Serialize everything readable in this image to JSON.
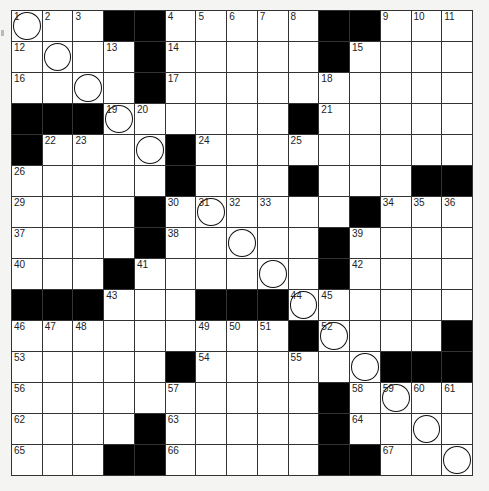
{
  "puzzle": {
    "rows": 15,
    "cols": 15,
    "layout": [
      "...##.....##...",
      "....#.....#....",
      "....#..........",
      "###......#.....",
      "#....#.........",
      ".....#...#...###",
      "....#......#...",
      "....#.....#....",
      "...#......#....",
      "###...###......",
      ".........#....#",
      ".....#......###",
      "..........#....",
      "....#.....#....",
      "...##.....##..."
    ],
    "numbers": [
      {
        "r": 0,
        "c": 0,
        "n": "1"
      },
      {
        "r": 0,
        "c": 1,
        "n": "2"
      },
      {
        "r": 0,
        "c": 2,
        "n": "3"
      },
      {
        "r": 0,
        "c": 5,
        "n": "4"
      },
      {
        "r": 0,
        "c": 6,
        "n": "5"
      },
      {
        "r": 0,
        "c": 7,
        "n": "6"
      },
      {
        "r": 0,
        "c": 8,
        "n": "7"
      },
      {
        "r": 0,
        "c": 9,
        "n": "8"
      },
      {
        "r": 0,
        "c": 12,
        "n": "9"
      },
      {
        "r": 0,
        "c": 13,
        "n": "10"
      },
      {
        "r": 0,
        "c": 14,
        "n": "11"
      },
      {
        "r": 1,
        "c": 0,
        "n": "12"
      },
      {
        "r": 1,
        "c": 3,
        "n": "13"
      },
      {
        "r": 1,
        "c": 5,
        "n": "14"
      },
      {
        "r": 1,
        "c": 11,
        "n": "15"
      },
      {
        "r": 2,
        "c": 0,
        "n": "16"
      },
      {
        "r": 2,
        "c": 5,
        "n": "17"
      },
      {
        "r": 2,
        "c": 10,
        "n": "18"
      },
      {
        "r": 3,
        "c": 3,
        "n": "19"
      },
      {
        "r": 3,
        "c": 4,
        "n": "20"
      },
      {
        "r": 3,
        "c": 10,
        "n": "21"
      },
      {
        "r": 4,
        "c": 1,
        "n": "22"
      },
      {
        "r": 4,
        "c": 2,
        "n": "23"
      },
      {
        "r": 4,
        "c": 6,
        "n": "24"
      },
      {
        "r": 4,
        "c": 9,
        "n": "25"
      },
      {
        "r": 5,
        "c": 0,
        "n": "26"
      },
      {
        "r": 5,
        "c": 5,
        "n": "27"
      },
      {
        "r": 5,
        "c": 9,
        "n": "28"
      },
      {
        "r": 6,
        "c": 0,
        "n": "29"
      },
      {
        "r": 6,
        "c": 5,
        "n": "30"
      },
      {
        "r": 6,
        "c": 6,
        "n": "31"
      },
      {
        "r": 6,
        "c": 7,
        "n": "32"
      },
      {
        "r": 6,
        "c": 8,
        "n": "33"
      },
      {
        "r": 6,
        "c": 12,
        "n": "34"
      },
      {
        "r": 6,
        "c": 13,
        "n": "35"
      },
      {
        "r": 6,
        "c": 14,
        "n": "36"
      },
      {
        "r": 7,
        "c": 0,
        "n": "37"
      },
      {
        "r": 7,
        "c": 5,
        "n": "38"
      },
      {
        "r": 7,
        "c": 11,
        "n": "39"
      },
      {
        "r": 8,
        "c": 0,
        "n": "40"
      },
      {
        "r": 8,
        "c": 4,
        "n": "41"
      },
      {
        "r": 8,
        "c": 11,
        "n": "42"
      },
      {
        "r": 9,
        "c": 3,
        "n": "43"
      },
      {
        "r": 9,
        "c": 9,
        "n": "44"
      },
      {
        "r": 9,
        "c": 10,
        "n": "45"
      },
      {
        "r": 10,
        "c": 0,
        "n": "46"
      },
      {
        "r": 10,
        "c": 1,
        "n": "47"
      },
      {
        "r": 10,
        "c": 2,
        "n": "48"
      },
      {
        "r": 10,
        "c": 6,
        "n": "49"
      },
      {
        "r": 10,
        "c": 7,
        "n": "50"
      },
      {
        "r": 10,
        "c": 8,
        "n": "51"
      },
      {
        "r": 10,
        "c": 10,
        "n": "52"
      },
      {
        "r": 11,
        "c": 0,
        "n": "53"
      },
      {
        "r": 11,
        "c": 6,
        "n": "54"
      },
      {
        "r": 11,
        "c": 9,
        "n": "55"
      },
      {
        "r": 12,
        "c": 0,
        "n": "56"
      },
      {
        "r": 12,
        "c": 5,
        "n": "57"
      },
      {
        "r": 12,
        "c": 11,
        "n": "58"
      },
      {
        "r": 12,
        "c": 12,
        "n": "59"
      },
      {
        "r": 12,
        "c": 13,
        "n": "60"
      },
      {
        "r": 12,
        "c": 14,
        "n": "61"
      },
      {
        "r": 13,
        "c": 0,
        "n": "62"
      },
      {
        "r": 13,
        "c": 5,
        "n": "63"
      },
      {
        "r": 13,
        "c": 11,
        "n": "64"
      },
      {
        "r": 14,
        "c": 0,
        "n": "65"
      },
      {
        "r": 14,
        "c": 5,
        "n": "66"
      },
      {
        "r": 14,
        "c": 12,
        "n": "67"
      }
    ],
    "circles": [
      [
        0,
        0
      ],
      [
        1,
        1
      ],
      [
        2,
        2
      ],
      [
        3,
        3
      ],
      [
        4,
        4
      ],
      [
        5,
        5
      ],
      [
        6,
        6
      ],
      [
        7,
        7
      ],
      [
        8,
        8
      ],
      [
        9,
        9
      ],
      [
        10,
        10
      ],
      [
        11,
        11
      ],
      [
        12,
        12
      ],
      [
        13,
        13
      ],
      [
        14,
        14
      ]
    ],
    "colors": {
      "black_square": "#000000",
      "white_square": "#ffffff",
      "grid_line": "#333333"
    }
  }
}
